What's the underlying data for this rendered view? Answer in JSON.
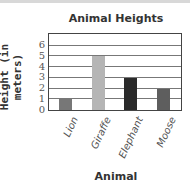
{
  "chart_data": {
    "type": "bar",
    "title": "Animal Heights",
    "xlabel": "Animal",
    "ylabel": "Height (in meters)",
    "categories": [
      "Lion",
      "Giraffe",
      "Elephant",
      "Moose"
    ],
    "values": [
      1,
      5,
      3,
      2
    ],
    "colors": [
      "#777777",
      "#b5b5b5",
      "#2a2a2a",
      "#5e5e5e"
    ],
    "yticks": [
      0,
      1,
      2,
      3,
      4,
      5,
      6
    ],
    "ylim": [
      0,
      7
    ],
    "grid": true
  }
}
